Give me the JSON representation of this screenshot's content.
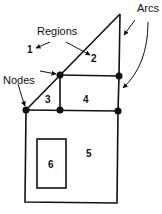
{
  "labels": {
    "regions": "Regions",
    "arcs": "Arcs",
    "nodes": "Nodes"
  },
  "regions": [
    "1",
    "2",
    "3",
    "4",
    "5",
    "6"
  ],
  "colors": {
    "ink": "#111111",
    "background": "#ffffff"
  }
}
